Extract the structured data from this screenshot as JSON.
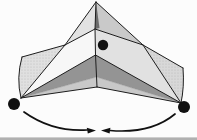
{
  "figure": {
    "kind": "origami-fold-diagram",
    "points": {
      "upper": "marked point on upper right face",
      "left": "marked point at left bottom corner",
      "right": "marked point at right bottom corner"
    },
    "arrows": {
      "left": "curved arrow from left corner point sweeping right toward center",
      "right": "curved arrow from right corner point sweeping left toward center"
    }
  },
  "colors": {
    "background": "#fcfcfc",
    "line": "#1d1d1d",
    "ink": "#111111",
    "tent_left": "#e2e2e2",
    "tent_right": "#c9c9c9",
    "sliver": "#6b6b6b",
    "wing_left": "#e0e0e0",
    "wing_right": "#d8d8d8",
    "band_left": "#f7f7f7",
    "band_right": "#e1e1e1",
    "chevron_dark": "#949494",
    "chevron_mid": "#c8c8c8",
    "fold_seam": "#8f8f8f",
    "scan_strip": "#b0b0b0"
  }
}
